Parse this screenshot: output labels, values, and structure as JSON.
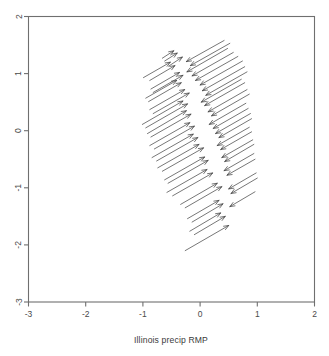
{
  "figure": {
    "title": "",
    "xlabel": "Illinois precip RMP",
    "ylabel": ""
  },
  "chart_data": {
    "type": "scatter",
    "subtype": "vector-field",
    "title": "",
    "xlabel": "Illinois precip RMP",
    "ylabel": "",
    "xlim": [
      -3,
      2
    ],
    "ylim": [
      -3,
      2
    ],
    "xticks": [
      -3,
      -2,
      -1,
      0,
      1,
      2
    ],
    "yticks": [
      -3,
      -2,
      -1,
      0,
      1,
      2
    ],
    "xticklabels": [
      "-3",
      "-2",
      "-1",
      "0",
      "1",
      "2"
    ],
    "yticklabels": [
      "-3",
      "-2",
      "-1",
      "0",
      "1",
      "2"
    ],
    "ytick_label_rotation": 90,
    "grid": false,
    "legend": null,
    "frame": "box",
    "tick_side": [
      "left",
      "bottom"
    ],
    "arrow_style": "open-triangle-head",
    "arrow_color": "#4a4a4a",
    "vectors": [
      {
        "x": -0.46,
        "y": 1.4,
        "tail_x": -0.66,
        "tail_y": 1.27
      },
      {
        "x": -0.4,
        "y": 1.36,
        "tail_x": -0.62,
        "tail_y": 1.22
      },
      {
        "x": -0.31,
        "y": 1.29,
        "tail_x": -0.55,
        "tail_y": 1.13
      },
      {
        "x": -0.52,
        "y": 1.2,
        "tail_x": -0.99,
        "tail_y": 0.93
      },
      {
        "x": -0.44,
        "y": 1.14,
        "tail_x": -0.88,
        "tail_y": 0.88
      },
      {
        "x": -0.24,
        "y": 1.21,
        "tail_x": 0.42,
        "tail_y": 1.58
      },
      {
        "x": -0.17,
        "y": 1.14,
        "tail_x": 0.52,
        "tail_y": 1.53
      },
      {
        "x": -0.36,
        "y": 1.02,
        "tail_x": -0.86,
        "tail_y": 0.73
      },
      {
        "x": -0.3,
        "y": 0.97,
        "tail_x": -0.82,
        "tail_y": 0.67
      },
      {
        "x": -0.23,
        "y": 1.03,
        "tail_x": 0.48,
        "tail_y": 1.44
      },
      {
        "x": -0.14,
        "y": 0.96,
        "tail_x": 0.58,
        "tail_y": 1.37
      },
      {
        "x": -0.41,
        "y": 0.88,
        "tail_x": -0.95,
        "tail_y": 0.57
      },
      {
        "x": -0.33,
        "y": 0.84,
        "tail_x": -0.9,
        "tail_y": 0.51
      },
      {
        "x": -0.08,
        "y": 0.88,
        "tail_x": 0.66,
        "tail_y": 1.3
      },
      {
        "x": 0.0,
        "y": 0.8,
        "tail_x": 0.74,
        "tail_y": 1.22
      },
      {
        "x": -0.27,
        "y": 0.72,
        "tail_x": -0.88,
        "tail_y": 0.37
      },
      {
        "x": -0.19,
        "y": 0.66,
        "tail_x": -0.82,
        "tail_y": 0.3
      },
      {
        "x": 0.04,
        "y": 0.7,
        "tail_x": 0.78,
        "tail_y": 1.12
      },
      {
        "x": 0.1,
        "y": 0.62,
        "tail_x": 0.82,
        "tail_y": 1.03
      },
      {
        "x": -0.3,
        "y": 0.52,
        "tail_x": -1.01,
        "tail_y": 0.11
      },
      {
        "x": -0.22,
        "y": 0.47,
        "tail_x": -0.95,
        "tail_y": 0.05
      },
      {
        "x": 0.02,
        "y": 0.5,
        "tail_x": 0.72,
        "tail_y": 0.9
      },
      {
        "x": 0.08,
        "y": 0.44,
        "tail_x": 0.78,
        "tail_y": 0.84
      },
      {
        "x": -0.24,
        "y": 0.35,
        "tail_x": -0.92,
        "tail_y": -0.05
      },
      {
        "x": -0.16,
        "y": 0.29,
        "tail_x": -0.86,
        "tail_y": -0.11
      },
      {
        "x": 0.14,
        "y": 0.33,
        "tail_x": 0.82,
        "tail_y": 0.72
      },
      {
        "x": 0.2,
        "y": 0.26,
        "tail_x": 0.86,
        "tail_y": 0.64
      },
      {
        "x": -0.18,
        "y": 0.14,
        "tail_x": -0.88,
        "tail_y": -0.26
      },
      {
        "x": -0.1,
        "y": 0.08,
        "tail_x": -0.8,
        "tail_y": -0.32
      },
      {
        "x": 0.16,
        "y": 0.11,
        "tail_x": 0.8,
        "tail_y": 0.48
      },
      {
        "x": 0.23,
        "y": 0.04,
        "tail_x": 0.84,
        "tail_y": 0.39
      },
      {
        "x": -0.12,
        "y": -0.06,
        "tail_x": -0.84,
        "tail_y": -0.47
      },
      {
        "x": -0.04,
        "y": -0.12,
        "tail_x": -0.76,
        "tail_y": -0.53
      },
      {
        "x": 0.27,
        "y": -0.05,
        "tail_x": 0.88,
        "tail_y": 0.3
      },
      {
        "x": 0.33,
        "y": -0.12,
        "tail_x": 0.9,
        "tail_y": 0.21
      },
      {
        "x": -0.02,
        "y": -0.24,
        "tail_x": -0.74,
        "tail_y": -0.65
      },
      {
        "x": 0.06,
        "y": -0.3,
        "tail_x": -0.66,
        "tail_y": -0.71
      },
      {
        "x": 0.3,
        "y": -0.26,
        "tail_x": 0.86,
        "tail_y": 0.06
      },
      {
        "x": 0.36,
        "y": -0.33,
        "tail_x": 0.9,
        "tail_y": -0.02
      },
      {
        "x": 0.08,
        "y": -0.46,
        "tail_x": -0.62,
        "tail_y": -0.86
      },
      {
        "x": 0.14,
        "y": -0.52,
        "tail_x": -0.56,
        "tail_y": -0.92
      },
      {
        "x": 0.38,
        "y": -0.47,
        "tail_x": 0.92,
        "tail_y": -0.16
      },
      {
        "x": 0.43,
        "y": -0.54,
        "tail_x": 0.94,
        "tail_y": -0.24
      },
      {
        "x": 0.12,
        "y": -0.68,
        "tail_x": -0.58,
        "tail_y": -1.08
      },
      {
        "x": 0.22,
        "y": -0.74,
        "tail_x": -0.48,
        "tail_y": -1.14
      },
      {
        "x": 0.42,
        "y": -0.7,
        "tail_x": 0.94,
        "tail_y": -0.4
      },
      {
        "x": 0.47,
        "y": -0.78,
        "tail_x": 0.96,
        "tail_y": -0.5
      },
      {
        "x": 0.3,
        "y": -0.92,
        "tail_x": -0.34,
        "tail_y": -1.29
      },
      {
        "x": 0.38,
        "y": -0.98,
        "tail_x": -0.26,
        "tail_y": -1.35
      },
      {
        "x": 0.5,
        "y": -1.02,
        "tail_x": 0.98,
        "tail_y": -0.74
      },
      {
        "x": 0.54,
        "y": -1.1,
        "tail_x": 1.0,
        "tail_y": -0.83
      },
      {
        "x": 0.33,
        "y": -1.22,
        "tail_x": -0.22,
        "tail_y": -1.54
      },
      {
        "x": 0.4,
        "y": -1.28,
        "tail_x": -0.14,
        "tail_y": -1.6
      },
      {
        "x": 0.52,
        "y": -1.33,
        "tail_x": 0.96,
        "tail_y": -1.07
      },
      {
        "x": 0.36,
        "y": -1.44,
        "tail_x": -0.18,
        "tail_y": -1.76
      },
      {
        "x": 0.44,
        "y": -1.5,
        "tail_x": -0.1,
        "tail_y": -1.82
      },
      {
        "x": 0.5,
        "y": -1.66,
        "tail_x": -0.26,
        "tail_y": -2.1
      }
    ]
  }
}
